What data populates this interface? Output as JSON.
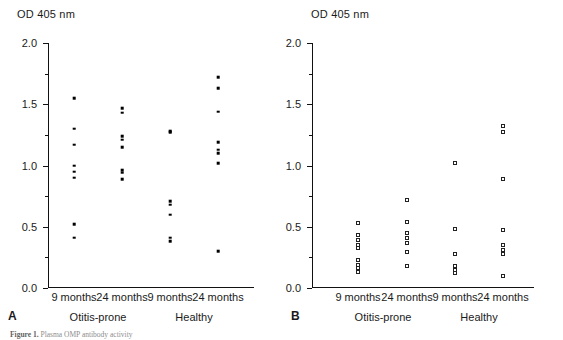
{
  "figure": {
    "caption_prefix": "Figure 1.",
    "caption_text": "Plasma OMP antibody activity"
  },
  "axis": {
    "y_title": "OD 405 nm",
    "y_min": 0.0,
    "y_max": 2.0,
    "y_major_ticks": [
      "0.0",
      "0.5",
      "1.0",
      "1.5",
      "2.0"
    ],
    "y_major_values": [
      0.0,
      0.5,
      1.0,
      1.5,
      2.0
    ],
    "y_minor_values": [
      0.25,
      0.75,
      1.25,
      1.75
    ]
  },
  "x_tick_labels": [
    "9 months",
    "24 months",
    "9 months",
    "24 months"
  ],
  "group_labels": [
    "Otitis-prone",
    "Healthy"
  ],
  "panels": [
    {
      "letter": "A",
      "marker": "filled-dot"
    },
    {
      "letter": "B",
      "marker": "open-square"
    }
  ],
  "chart_data": [
    {
      "type": "scatter",
      "panel": "A",
      "title": "",
      "xlabel": "",
      "ylabel": "OD 405 nm",
      "ylim": [
        0.0,
        2.0
      ],
      "grid": false,
      "legend": "none",
      "marker": "filled-dot",
      "categories": [
        "9 months",
        "24 months",
        "9 months",
        "24 months"
      ],
      "group_spans": [
        {
          "label": "Otitis-prone",
          "categories": [
            "9 months",
            "24 months"
          ]
        },
        {
          "label": "Healthy",
          "categories": [
            "9 months",
            "24 months"
          ]
        }
      ],
      "series": [
        {
          "name": "Otitis-prone 9 months",
          "category": "9 months",
          "group": "Otitis-prone",
          "values": [
            1.55,
            1.3,
            1.17,
            1.0,
            0.95,
            0.9,
            0.52,
            0.41
          ]
        },
        {
          "name": "Otitis-prone 24 months",
          "category": "24 months",
          "group": "Otitis-prone",
          "values": [
            1.47,
            1.43,
            1.24,
            1.21,
            1.15,
            0.96,
            0.94,
            0.89
          ]
        },
        {
          "name": "Healthy 9 months",
          "category": "9 months",
          "group": "Healthy",
          "values": [
            1.28,
            1.27,
            0.71,
            0.68,
            0.6,
            0.41,
            0.38
          ]
        },
        {
          "name": "Healthy 24 months",
          "category": "24 months",
          "group": "Healthy",
          "values": [
            1.72,
            1.63,
            1.44,
            1.19,
            1.13,
            1.1,
            1.02,
            0.3
          ]
        }
      ]
    },
    {
      "type": "scatter",
      "panel": "B",
      "title": "",
      "xlabel": "",
      "ylabel": "OD 405 nm",
      "ylim": [
        0.0,
        2.0
      ],
      "grid": false,
      "legend": "none",
      "marker": "open-square",
      "categories": [
        "9 months",
        "24 months",
        "9 months",
        "24 months"
      ],
      "group_spans": [
        {
          "label": "Otitis-prone",
          "categories": [
            "9 months",
            "24 months"
          ]
        },
        {
          "label": "Healthy",
          "categories": [
            "9 months",
            "24 months"
          ]
        }
      ],
      "series": [
        {
          "name": "Otitis-prone 9 months",
          "category": "9 months",
          "group": "Otitis-prone",
          "values": [
            0.53,
            0.43,
            0.39,
            0.35,
            0.33,
            0.23,
            0.19,
            0.16,
            0.13
          ]
        },
        {
          "name": "Otitis-prone 24 months",
          "category": "24 months",
          "group": "Otitis-prone",
          "values": [
            0.72,
            0.54,
            0.45,
            0.41,
            0.37,
            0.29,
            0.18
          ]
        },
        {
          "name": "Healthy 9 months",
          "category": "9 months",
          "group": "Healthy",
          "values": [
            1.02,
            0.48,
            0.28,
            0.18,
            0.15,
            0.12
          ]
        },
        {
          "name": "Healthy 24 months",
          "category": "24 months",
          "group": "Healthy",
          "values": [
            1.32,
            1.27,
            0.89,
            0.47,
            0.35,
            0.31,
            0.28,
            0.1
          ]
        }
      ]
    }
  ]
}
